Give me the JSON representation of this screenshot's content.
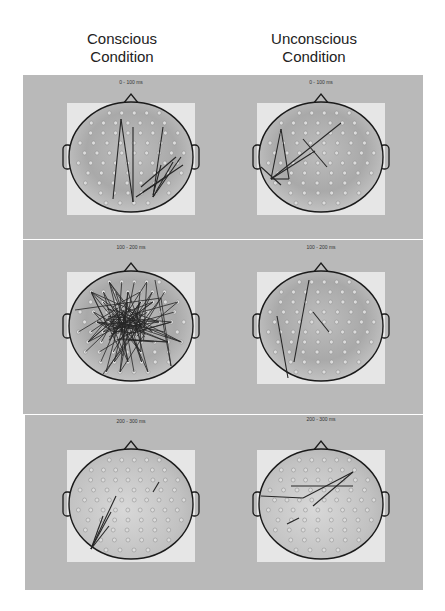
{
  "columns": [
    {
      "title_line1": "Conscious",
      "title_line2": "Condition"
    },
    {
      "title_line1": "Unconscious",
      "title_line2": "Condition"
    }
  ],
  "rows": [
    {
      "time_window_left": "0 - 100 ms",
      "time_window_right": "0 - 100 ms"
    },
    {
      "time_window_left": "100 - 200 ms",
      "time_window_right": "100 - 200 ms"
    },
    {
      "time_window_left": "200 - 300 ms",
      "time_window_right": "200 - 300 ms"
    }
  ],
  "colors": {
    "panel_bg": "#b9b9b9",
    "map_bg": "#e6e6e6",
    "head_outline": "#1a1a1a",
    "electrode": "#dcdcdc",
    "connection": "#262626"
  },
  "maps": [
    {
      "id": "conscious-0-100",
      "cx": 131,
      "cy": 157,
      "density": "sparse",
      "connections": [
        [
          -10,
          -38,
          -18,
          42
        ],
        [
          -10,
          -38,
          2,
          45
        ],
        [
          2,
          -30,
          2,
          45
        ],
        [
          32,
          -30,
          22,
          40
        ],
        [
          22,
          40,
          42,
          5
        ],
        [
          22,
          40,
          50,
          0
        ],
        [
          10,
          30,
          45,
          0
        ],
        [
          12,
          35,
          52,
          8
        ],
        [
          5,
          40,
          35,
          20
        ],
        [
          22,
          38,
          30,
          8
        ]
      ]
    },
    {
      "id": "unconscious-0-100",
      "cx": 321,
      "cy": 157,
      "density": "sparse",
      "connections": [
        [
          -40,
          -28,
          -50,
          22
        ],
        [
          -40,
          -28,
          -32,
          22
        ],
        [
          -50,
          22,
          -32,
          22
        ],
        [
          -50,
          22,
          20,
          -34
        ],
        [
          -50,
          22,
          -6,
          -6
        ],
        [
          -18,
          -18,
          6,
          10
        ],
        [
          -60,
          10,
          -40,
          28
        ]
      ]
    },
    {
      "id": "conscious-100-200",
      "cx": 131,
      "cy": 326,
      "density": "dense",
      "connections": "dense"
    },
    {
      "id": "unconscious-100-200",
      "cx": 321,
      "cy": 326,
      "density": "sparse",
      "connections": [
        [
          -44,
          -10,
          -33,
          52
        ],
        [
          -12,
          -46,
          -27,
          36
        ],
        [
          -8,
          -14,
          8,
          6
        ]
      ]
    },
    {
      "id": "conscious-200-300",
      "cx": 131,
      "cy": 504,
      "density": "sparse",
      "connections": [
        [
          -40,
          45,
          -15,
          -8
        ],
        [
          -40,
          45,
          -20,
          8
        ],
        [
          -40,
          45,
          -28,
          12
        ],
        [
          -40,
          45,
          -22,
          22
        ],
        [
          22,
          -12,
          28,
          -22
        ]
      ]
    },
    {
      "id": "unconscious-200-300",
      "cx": 321,
      "cy": 504,
      "density": "sparse",
      "connections": [
        [
          -60,
          -8,
          -18,
          -6
        ],
        [
          -18,
          -6,
          32,
          -32
        ],
        [
          -30,
          -18,
          32,
          -18
        ],
        [
          -8,
          2,
          32,
          -32
        ],
        [
          -34,
          20,
          -22,
          14
        ]
      ]
    }
  ]
}
